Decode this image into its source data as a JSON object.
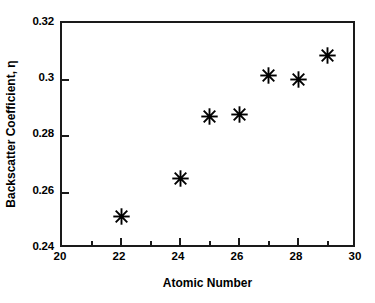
{
  "chart_data": {
    "type": "scatter",
    "title": "",
    "xlabel": "Atomic Number",
    "ylabel": "Backscatter Coefficient, η",
    "xlim": [
      20,
      30
    ],
    "ylim": [
      0.24,
      0.32
    ],
    "grid": false,
    "legend": null,
    "marker": "asterisk-8-point",
    "marker_color": "#000000",
    "xticks": [
      "20",
      "22",
      "24",
      "26",
      "28",
      "30"
    ],
    "xtick_values": [
      20,
      22,
      24,
      26,
      28,
      30
    ],
    "xminor_values": [
      21,
      23,
      25,
      27,
      29
    ],
    "yticks": [
      "0.24",
      "0.26",
      "0.28",
      "0.3",
      "0.32"
    ],
    "ytick_values": [
      0.24,
      0.26,
      0.28,
      0.3,
      0.32
    ],
    "x": [
      22,
      24,
      25,
      26,
      27,
      28,
      29
    ],
    "y": [
      0.2515,
      0.265,
      0.287,
      0.2875,
      0.3015,
      0.3,
      0.3085
    ],
    "points": [
      {
        "x": 22,
        "y": 0.2515
      },
      {
        "x": 24,
        "y": 0.265
      },
      {
        "x": 25,
        "y": 0.287
      },
      {
        "x": 26,
        "y": 0.2875
      },
      {
        "x": 27,
        "y": 0.3015
      },
      {
        "x": 28,
        "y": 0.3
      },
      {
        "x": 29,
        "y": 0.3085
      }
    ]
  },
  "figure": {
    "background": "#ffffff",
    "axis_color": "#1a1a1a"
  }
}
